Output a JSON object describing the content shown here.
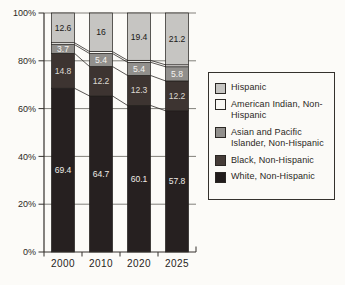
{
  "figure": {
    "background": "#fcfbf8"
  },
  "chart_data": {
    "type": "bar",
    "variant": "100-percent-stacked-column",
    "title": "",
    "xlabel": "",
    "ylabel": "",
    "categories": [
      "2000",
      "2010",
      "2020",
      "2025"
    ],
    "series": [
      {
        "name": "White, Non-Hispanic",
        "color": "#262020",
        "label_color": "#eeebe6",
        "labeled": true,
        "values": [
          69.4,
          64.7,
          60.1,
          57.8
        ]
      },
      {
        "name": "Black, Non-Hispanic",
        "color": "#3d3431",
        "label_color": "#ddd8d2",
        "labeled": true,
        "values": [
          14.8,
          12.2,
          12.3,
          12.2
        ]
      },
      {
        "name": "Asian and Pacific Islander, Non-Hispanic",
        "color": "#918f8c",
        "label_color": "#f5f3ef",
        "labeled": true,
        "values": [
          3.7,
          5.4,
          5.4,
          5.8
        ]
      },
      {
        "name": "American Indian, Non-Hispanic",
        "color": "#f8f7f3",
        "label_color": "#1b1917",
        "labeled": false,
        "estimated": true,
        "values": [
          0.8,
          0.8,
          0.8,
          0.8
        ]
      },
      {
        "name": "Hispanic",
        "color": "#c6c5c2",
        "label_color": "#1b1917",
        "labeled": true,
        "values": [
          12.6,
          16,
          19.4,
          21.2
        ]
      }
    ],
    "ylim": [
      0,
      100
    ],
    "yticks": [
      "0%",
      "20%",
      "40%",
      "60%",
      "80%",
      "100%"
    ],
    "grid": true,
    "connector_lines": true,
    "legend_position": "right"
  },
  "legend": {
    "items": [
      {
        "label": "Hispanic",
        "color": "#c6c5c2"
      },
      {
        "label": "American Indian, Non-Hispanic",
        "color": "#f8f7f3"
      },
      {
        "label": "Asian and Pacific Islander, Non-Hispanic",
        "color": "#918f8c"
      },
      {
        "label": "Black, Non-Hispanic",
        "color": "#453c38"
      },
      {
        "label": "White, Non-Hispanic",
        "color": "#211c1c"
      }
    ]
  },
  "style": {
    "grid_color": "#4d4a45",
    "axis_color": "#34312d",
    "segment_outline": "#201d1b",
    "tick_label_color": "#2b2824",
    "year_label_color": "#262320"
  }
}
